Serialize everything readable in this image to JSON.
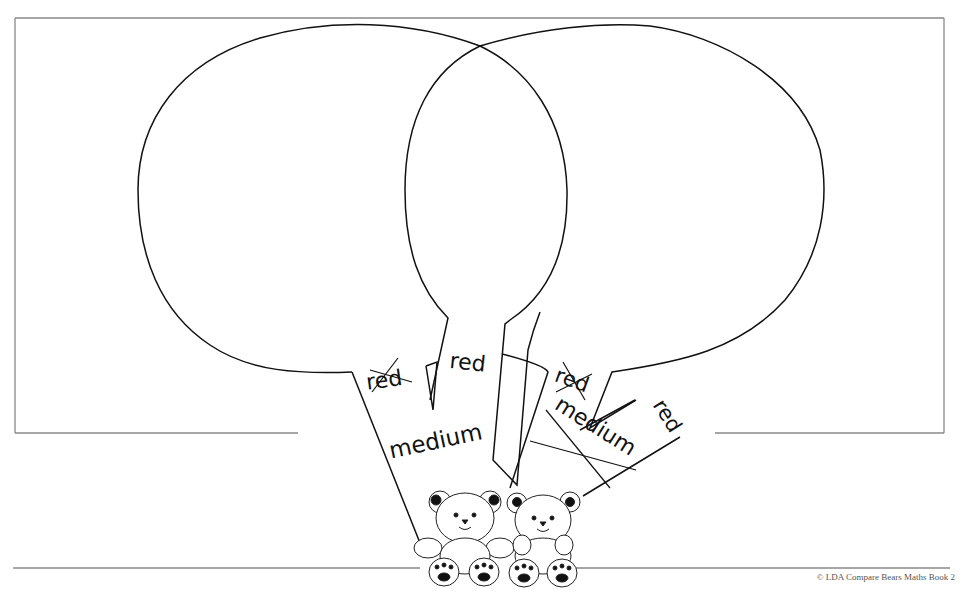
{
  "worksheet": {
    "type": "venn-balloon-sort",
    "left_balloon": {
      "labels": [
        {
          "text": "red",
          "crossed": true
        },
        {
          "text": "medium",
          "crossed": false
        }
      ]
    },
    "middle_string": {
      "labels": [
        {
          "text": "red",
          "crossed": false
        }
      ]
    },
    "right_balloon": {
      "labels": [
        {
          "text": "red",
          "crossed": true
        },
        {
          "text": "medium",
          "crossed": true
        },
        {
          "text": "red",
          "crossed": false
        }
      ]
    },
    "bears": [
      {
        "name": "bear-left"
      },
      {
        "name": "bear-right"
      }
    ]
  },
  "footer": {
    "copyright": "© LDA  Compare Bears Maths Book 2"
  },
  "colors": {
    "line": "#111111",
    "frame": "#888888",
    "background": "#ffffff"
  }
}
